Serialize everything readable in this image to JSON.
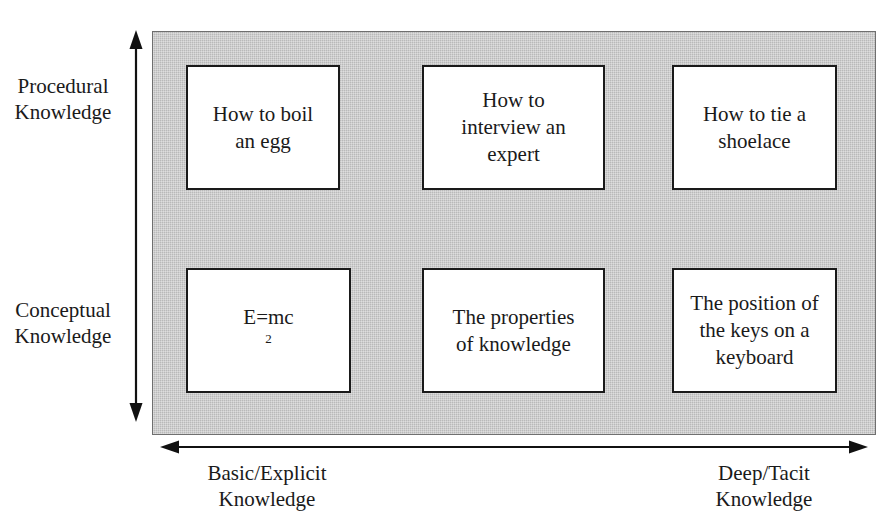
{
  "figure": {
    "clipped_caption_top": "",
    "panel_fill_color": "#b9b9b9",
    "box_border_color": "#1a1a1a",
    "box_fill_color": "#ffffff",
    "text_color": "#1a1a1a"
  },
  "axes": {
    "vertical": {
      "name": "knowledge-type-axis",
      "top_label_line1": "Procedural",
      "top_label_line2": "Knowledge",
      "bottom_label_line1": "Conceptual",
      "bottom_label_line2": "Knowledge",
      "arrow_style": "double-headed"
    },
    "horizontal": {
      "name": "knowledge-depth-axis",
      "left_label_line1": "Basic/Explicit",
      "left_label_line2": "Knowledge",
      "right_label_line1": "Deep/Tacit",
      "right_label_line2": "Knowledge",
      "arrow_style": "double-headed"
    }
  },
  "matrix": {
    "rows": [
      {
        "row_label": "Procedural Knowledge",
        "cells": [
          {
            "line1": "How to boil",
            "line2": "an egg",
            "line3": ""
          },
          {
            "line1": "How to",
            "line2": "interview an",
            "line3": "expert"
          },
          {
            "line1": "How to tie a",
            "line2": "shoelace",
            "line3": ""
          }
        ]
      },
      {
        "row_label": "Conceptual Knowledge",
        "cells": [
          {
            "line1": "E=mc",
            "line2": "",
            "line3": "",
            "superscript": "2"
          },
          {
            "line1": "The properties",
            "line2": "of knowledge",
            "line3": ""
          },
          {
            "line1": "The position of",
            "line2": "the keys on a",
            "line3": "keyboard"
          }
        ]
      }
    ]
  }
}
